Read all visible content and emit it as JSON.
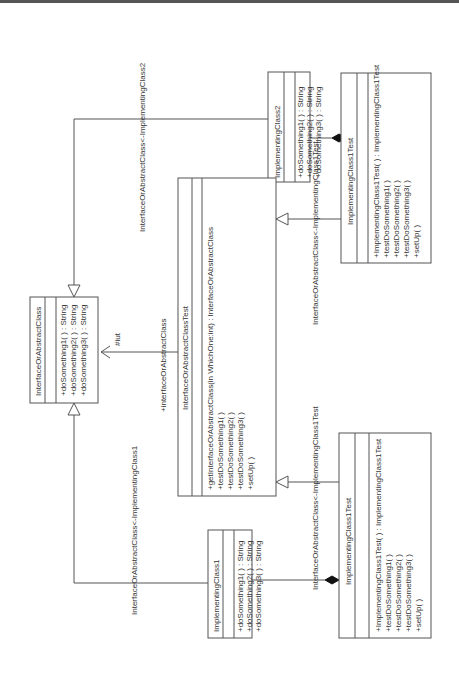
{
  "diagram": {
    "type": "UML class diagram (rotated 90° counter-clockwise)",
    "classes": [
      {
        "id": "iface",
        "name": "InterfaceOrAbstractClass",
        "attributes": [],
        "methods": [
          "+doSomething1( ) : String",
          "+doSomething2( ) : String",
          "+doSomething3( ) : String"
        ]
      },
      {
        "id": "impl1",
        "name": "ImplementingClass1",
        "attributes": [],
        "methods": [
          "+doSomething1( ) : String",
          "+doSomething2( ) : String",
          "+doSomething3( ) : String"
        ]
      },
      {
        "id": "impl2",
        "name": "ImplementingClass2",
        "attributes": [],
        "methods": [
          "+doSomething1( ) : String",
          "+doSomething2( ) : String",
          "+doSomething3( ) : String"
        ]
      },
      {
        "id": "ifaceTest",
        "name": "InterfaceOrAbstractClassTest",
        "attributes": [],
        "methods": [
          "+getInterfaceOrAbstractClass(in WhichOne:int) : InterfaceOrAbstractClass",
          "+testDoSomething1( )",
          "+testDoSomething2( )",
          "+testDoSomething3( )",
          "+setUp( )"
        ]
      },
      {
        "id": "impl1TestA",
        "name": "ImplementingClass1Test",
        "attributes": [],
        "methods": [
          "+ImplementingClass1Test( ) : ImplementingClass1Test",
          "+testDoSomething1( )",
          "+testDoSomething2( )",
          "+testDoSomething3( )",
          "+setUp( )"
        ]
      },
      {
        "id": "impl1TestB",
        "name": "ImplementingClass1Test",
        "attributes": [],
        "methods": [
          "+ImplementingClass1Test( ) : ImplementingClass1Test",
          "+testDoSomething1( )",
          "+testDoSomething2( )",
          "+testDoSomething3( )",
          "+setUp( )"
        ]
      }
    ],
    "relations": [
      {
        "from": "impl2",
        "to": "iface",
        "kind": "realization",
        "label": "InterfaceOrAbstractClass<-ImplementingClass2"
      },
      {
        "from": "impl1",
        "to": "iface",
        "kind": "realization",
        "label": "InterfaceOrAbstractClass<-ImplementingClass1"
      },
      {
        "from": "ifaceTest",
        "to": "iface",
        "kind": "association",
        "label": "+interfaceOrAbstractClass",
        "role": "#iut"
      },
      {
        "from": "impl1TestA",
        "to": "ifaceTest",
        "kind": "generalization",
        "label": "InterfaceOrAbstractClass<-ImplementingClass1Test"
      },
      {
        "from": "impl1TestB",
        "to": "ifaceTest",
        "kind": "generalization",
        "label": "InterfaceOrAbstractClass<-ImplementingClass1Test"
      },
      {
        "from": "impl2",
        "to": "impl1TestA",
        "kind": "composition"
      },
      {
        "from": "impl1",
        "to": "impl1TestB",
        "kind": "composition"
      }
    ]
  }
}
